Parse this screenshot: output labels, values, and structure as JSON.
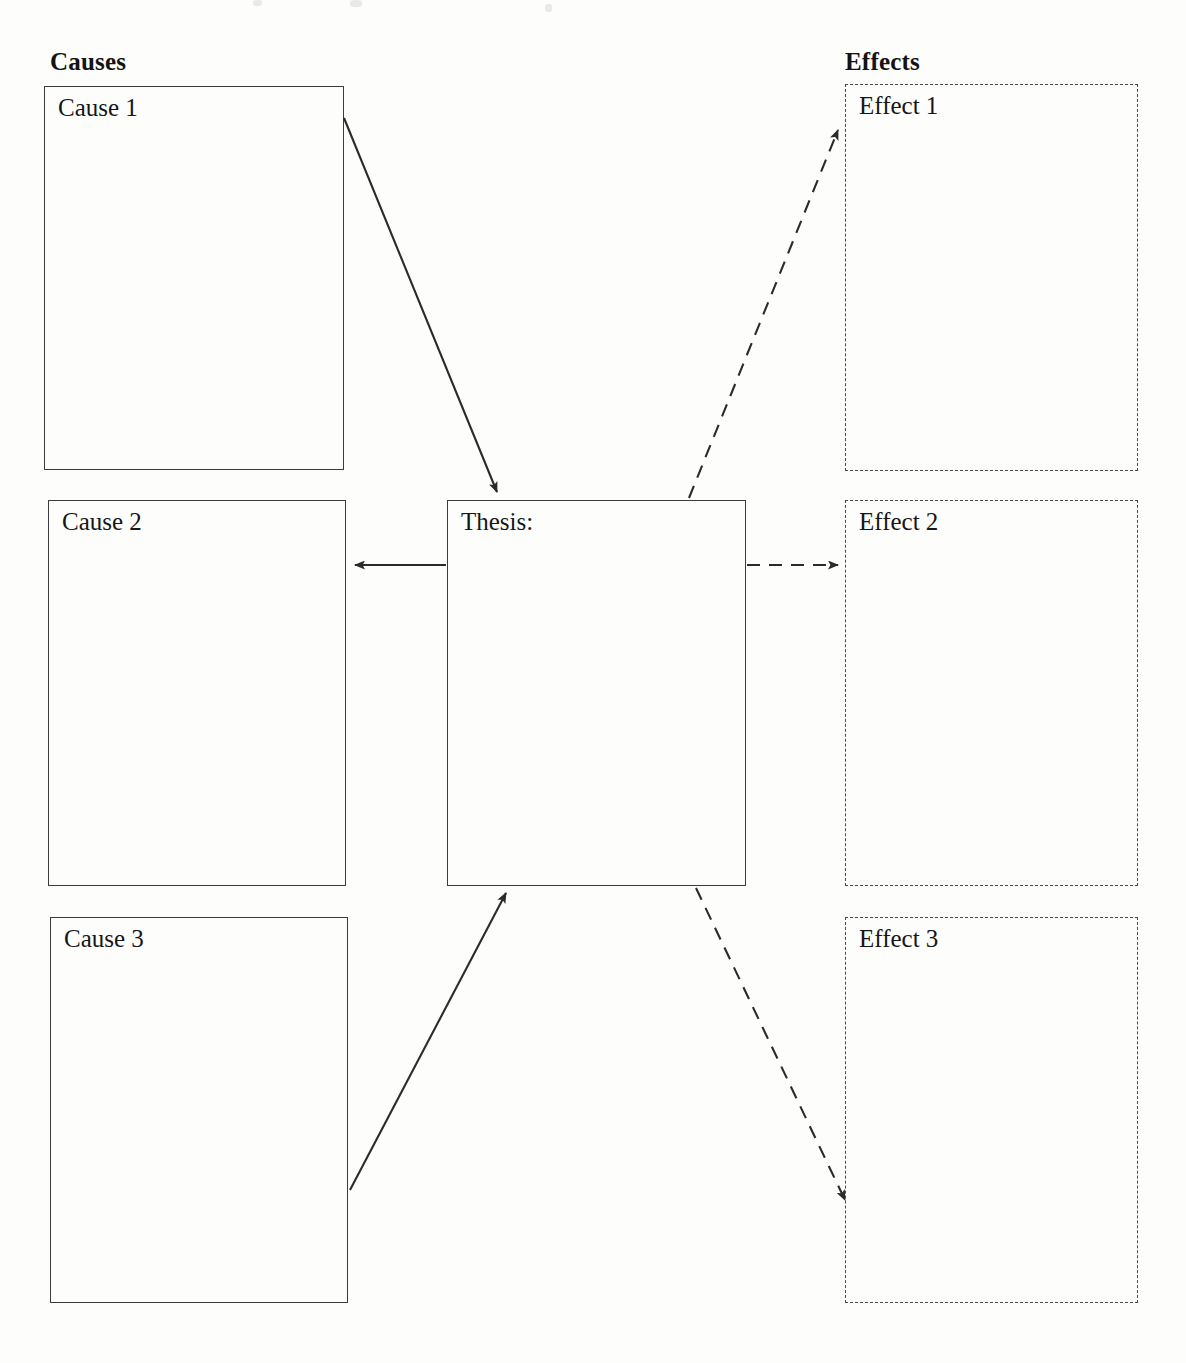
{
  "page": {
    "width": 1186,
    "height": 1363,
    "background_color": "#fdfdfc",
    "ink_color": "#1a1a1a"
  },
  "headings": {
    "causes": "Causes",
    "effects": "Effects"
  },
  "center": {
    "label": "Thesis:"
  },
  "causes": [
    {
      "label": "Cause 1"
    },
    {
      "label": "Cause 2"
    },
    {
      "label": "Cause 3"
    }
  ],
  "effects": [
    {
      "label": "Effect 1"
    },
    {
      "label": "Effect 2"
    },
    {
      "label": "Effect 3"
    }
  ],
  "connectors": [
    {
      "name": "cause-1-to-thesis",
      "style": "solid",
      "from": "Cause 1",
      "to": "Thesis:"
    },
    {
      "name": "thesis-to-cause-2",
      "style": "solid",
      "from": "Thesis:",
      "to": "Cause 2"
    },
    {
      "name": "cause-3-to-thesis",
      "style": "solid",
      "from": "Cause 3",
      "to": "Thesis:"
    },
    {
      "name": "thesis-to-effect-1",
      "style": "dashed",
      "from": "Thesis:",
      "to": "Effect 1"
    },
    {
      "name": "thesis-to-effect-2",
      "style": "dashed",
      "from": "Thesis:",
      "to": "Effect 2"
    },
    {
      "name": "thesis-to-effect-3",
      "style": "dashed",
      "from": "Thesis:",
      "to": "Effect 3"
    }
  ]
}
